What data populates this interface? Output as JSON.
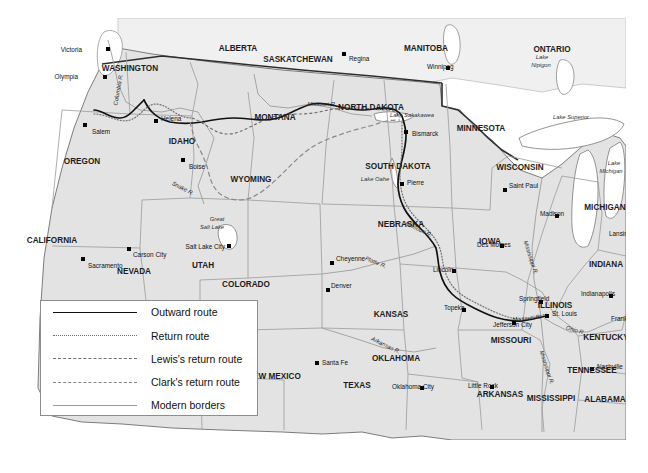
{
  "map": {
    "title": "Lewis and Clark Expedition route map",
    "colors": {
      "land": "#e3e3e3",
      "water": "#ffffff",
      "border_modern": "#9a9a9a",
      "border_country": "#3a3a3a",
      "route_outward": "#111111",
      "route_return": "#6e6e6e",
      "city_dot": "#000000",
      "background": "#ffffff",
      "legend_border": "#8d8d8d"
    }
  },
  "legend": {
    "items": [
      {
        "label": "Outward route",
        "style": "solid"
      },
      {
        "label": "Return route",
        "style": "dotted"
      },
      {
        "label": "Lewis's return route",
        "style": "dashed-small"
      },
      {
        "label": "Clark's return route",
        "style": "dashed-large"
      },
      {
        "label": "Modern borders",
        "style": "thin-solid"
      }
    ]
  },
  "states": [
    {
      "name": "WASHINGTON",
      "x": 108,
      "y": 53
    },
    {
      "name": "OREGON",
      "x": 60,
      "y": 146
    },
    {
      "name": "IDAHO",
      "x": 160,
      "y": 126
    },
    {
      "name": "CALIFORNIA",
      "x": 30,
      "y": 225
    },
    {
      "name": "NEVADA",
      "x": 112,
      "y": 256
    },
    {
      "name": "UTAH",
      "x": 181,
      "y": 250
    },
    {
      "name": "MONTANA",
      "x": 253,
      "y": 102
    },
    {
      "name": "WYOMING",
      "x": 229,
      "y": 164
    },
    {
      "name": "COLORADO",
      "x": 224,
      "y": 269
    },
    {
      "name": "NEW MEXICO",
      "x": 252,
      "y": 361
    },
    {
      "name": "ARIZONA",
      "x": 140,
      "y": 330
    },
    {
      "name": "TEXAS",
      "x": 335,
      "y": 370
    },
    {
      "name": "OKLAHOMA",
      "x": 374,
      "y": 343
    },
    {
      "name": "KANSAS",
      "x": 369,
      "y": 299
    },
    {
      "name": "NEBRASKA",
      "x": 379,
      "y": 209
    },
    {
      "name": "SOUTH DAKOTA",
      "x": 376,
      "y": 151
    },
    {
      "name": "NORTH DAKOTA",
      "x": 349,
      "y": 92
    },
    {
      "name": "MINNESOTA",
      "x": 459,
      "y": 113
    },
    {
      "name": "IOWA",
      "x": 468,
      "y": 226
    },
    {
      "name": "MISSOURI",
      "x": 489,
      "y": 325
    },
    {
      "name": "ARKANSAS",
      "x": 478,
      "y": 379
    },
    {
      "name": "MISSISSIPPI",
      "x": 529,
      "y": 383
    },
    {
      "name": "ALABAMA",
      "x": 583,
      "y": 384
    },
    {
      "name": "TENNESSEE",
      "x": 570,
      "y": 355
    },
    {
      "name": "KENTUCKY",
      "x": 584,
      "y": 322
    },
    {
      "name": "ILLINOIS",
      "x": 533,
      "y": 290
    },
    {
      "name": "INDIANA",
      "x": 584,
      "y": 249
    },
    {
      "name": "WISCONSIN",
      "x": 498,
      "y": 152
    },
    {
      "name": "MICHIGAN",
      "x": 583,
      "y": 192
    }
  ],
  "provinces": [
    {
      "name": "ALBERTA",
      "x": 216,
      "y": 33
    },
    {
      "name": "SASKATCHEWAN",
      "x": 276,
      "y": 44
    },
    {
      "name": "MANITOBA",
      "x": 404,
      "y": 33
    },
    {
      "name": "ONTARIO",
      "x": 530,
      "y": 34
    }
  ],
  "cities": [
    {
      "name": "Victoria",
      "label_x": 60,
      "label_y": 31,
      "dot_x": 86,
      "dot_y": 31,
      "anchor": "end"
    },
    {
      "name": "Olympia",
      "label_x": 56,
      "label_y": 58,
      "dot_x": 83,
      "dot_y": 59,
      "anchor": "end"
    },
    {
      "name": "Salem",
      "label_x": 70,
      "label_y": 113,
      "dot_x": 63,
      "dot_y": 107,
      "anchor": "start"
    },
    {
      "name": "Boise",
      "label_x": 167,
      "label_y": 148,
      "dot_x": 161,
      "dot_y": 142,
      "anchor": "start"
    },
    {
      "name": "Carson City",
      "label_x": 111,
      "label_y": 236,
      "dot_x": 107,
      "dot_y": 231,
      "anchor": "start"
    },
    {
      "name": "Sacramento",
      "label_x": 66,
      "label_y": 247,
      "dot_x": 61,
      "dot_y": 241,
      "anchor": "start"
    },
    {
      "name": "Salt Lake City",
      "label_x": 203,
      "label_y": 228,
      "dot_x": 207,
      "dot_y": 228,
      "anchor": "end"
    },
    {
      "name": "Helena",
      "label_x": 139,
      "label_y": 100,
      "dot_x": 134,
      "dot_y": 103,
      "anchor": "start"
    },
    {
      "name": "Regina",
      "label_x": 327,
      "label_y": 40,
      "dot_x": 322,
      "dot_y": 36,
      "anchor": "start"
    },
    {
      "name": "Winnipeg",
      "label_x": 405,
      "label_y": 48,
      "dot_x": 426,
      "dot_y": 50,
      "anchor": "start"
    },
    {
      "name": "Bismarck",
      "label_x": 390,
      "label_y": 115,
      "dot_x": 384,
      "dot_y": 114,
      "anchor": "start"
    },
    {
      "name": "Pierre",
      "label_x": 385,
      "label_y": 164,
      "dot_x": 380,
      "dot_y": 166,
      "anchor": "start"
    },
    {
      "name": "Saint Paul",
      "label_x": 487,
      "label_y": 167,
      "dot_x": 483,
      "dot_y": 172,
      "anchor": "start"
    },
    {
      "name": "Madison",
      "label_x": 518,
      "label_y": 195,
      "dot_x": 535,
      "dot_y": 198,
      "anchor": "start"
    },
    {
      "name": "Lansing",
      "label_x": 587,
      "label_y": 215,
      "dot_x": 612,
      "dot_y": 216,
      "anchor": "start"
    },
    {
      "name": "Des Moines",
      "label_x": 455,
      "label_y": 226,
      "dot_x": 480,
      "dot_y": 228,
      "anchor": "start"
    },
    {
      "name": "Cheyenne",
      "label_x": 314,
      "label_y": 240,
      "dot_x": 310,
      "dot_y": 245,
      "anchor": "start"
    },
    {
      "name": "Denver",
      "label_x": 309,
      "label_y": 267,
      "dot_x": 306,
      "dot_y": 272,
      "anchor": "start"
    },
    {
      "name": "Lincoln",
      "label_x": 411,
      "label_y": 251,
      "dot_x": 432,
      "dot_y": 253,
      "anchor": "start"
    },
    {
      "name": "Springfield",
      "label_x": 497,
      "label_y": 280,
      "dot_x": 519,
      "dot_y": 284,
      "anchor": "start"
    },
    {
      "name": "Indianapolis",
      "label_x": 559,
      "label_y": 275,
      "dot_x": 589,
      "dot_y": 278,
      "anchor": "start"
    },
    {
      "name": "Topeka",
      "label_x": 422,
      "label_y": 289,
      "dot_x": 442,
      "dot_y": 292,
      "anchor": "start"
    },
    {
      "name": "St. Louis",
      "label_x": 530,
      "label_y": 295,
      "dot_x": 525,
      "dot_y": 298,
      "anchor": "start"
    },
    {
      "name": "Frankfort",
      "label_x": 589,
      "label_y": 300,
      "dot_x": 617,
      "dot_y": 302,
      "anchor": "start"
    },
    {
      "name": "Jefferson City",
      "label_x": 471,
      "label_y": 306,
      "dot_x": 492,
      "dot_y": 305,
      "anchor": "start"
    },
    {
      "name": "Santa Fe",
      "label_x": 300,
      "label_y": 344,
      "dot_x": 295,
      "dot_y": 345,
      "anchor": "start"
    },
    {
      "name": "Nashville",
      "label_x": 575,
      "label_y": 348,
      "dot_x": 570,
      "dot_y": 351,
      "anchor": "start"
    },
    {
      "name": "Oklahoma City",
      "label_x": 370,
      "label_y": 368,
      "dot_x": 400,
      "dot_y": 370,
      "anchor": "start"
    },
    {
      "name": "Little Rock",
      "label_x": 446,
      "label_y": 367,
      "dot_x": 470,
      "dot_y": 369,
      "anchor": "start"
    }
  ],
  "water_labels": [
    {
      "name": "Lake Sakakawea",
      "x": 390,
      "y": 99
    },
    {
      "name": "Lake Oahe",
      "x": 353,
      "y": 163
    },
    {
      "name": "Great",
      "x": 195,
      "y": 203
    },
    {
      "name": "Salt Lake",
      "x": 190,
      "y": 211
    },
    {
      "name": "Lake",
      "x": 520,
      "y": 41
    },
    {
      "name": "Nipigon",
      "x": 519,
      "y": 49
    },
    {
      "name": "Lake Superior",
      "x": 549,
      "y": 101
    },
    {
      "name": "Lake",
      "x": 592,
      "y": 147
    },
    {
      "name": "Michigan",
      "x": 589,
      "y": 155
    }
  ],
  "rivers": [
    {
      "name": "Columbia R.",
      "x": 98,
      "y": 72,
      "rotate": -80
    },
    {
      "name": "Snake R.",
      "x": 160,
      "y": 172,
      "rotate": 28
    },
    {
      "name": "Missouri R.",
      "x": 300,
      "y": 88,
      "rotate": 0
    },
    {
      "name": "Missouri R.",
      "x": 396,
      "y": 213,
      "rotate": 26
    },
    {
      "name": "Missouri R.",
      "x": 505,
      "y": 302,
      "rotate": -6
    },
    {
      "name": "Platte R.",
      "x": 353,
      "y": 246,
      "rotate": 22
    },
    {
      "name": "Arkansas R.",
      "x": 363,
      "y": 329,
      "rotate": 26
    },
    {
      "name": "Mississippi R.",
      "x": 507,
      "y": 240,
      "rotate": 72
    },
    {
      "name": "Mississippi R.",
      "x": 523,
      "y": 350,
      "rotate": 72
    },
    {
      "name": "Ohio R.",
      "x": 553,
      "y": 314,
      "rotate": 16
    }
  ]
}
